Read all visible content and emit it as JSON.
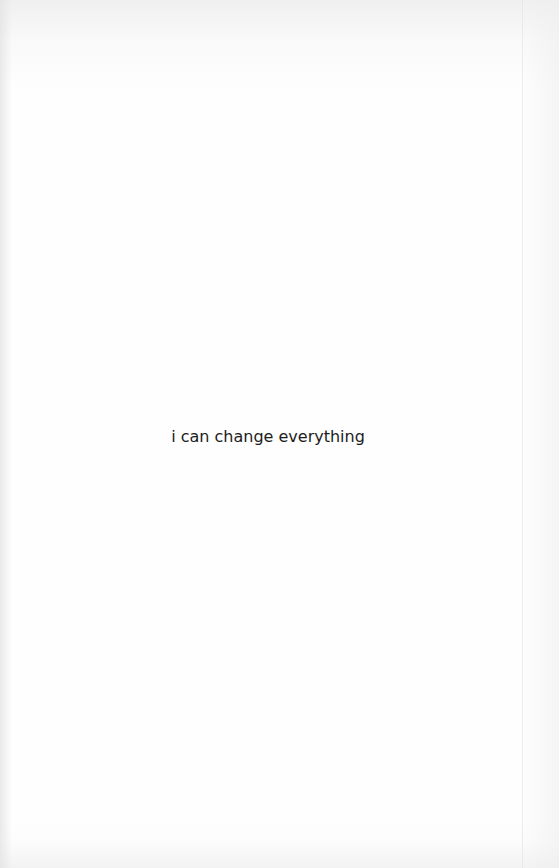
{
  "page": {
    "background": "#fefefe",
    "text_color": "#1c1c1c",
    "body_text": "i can change everything"
  }
}
